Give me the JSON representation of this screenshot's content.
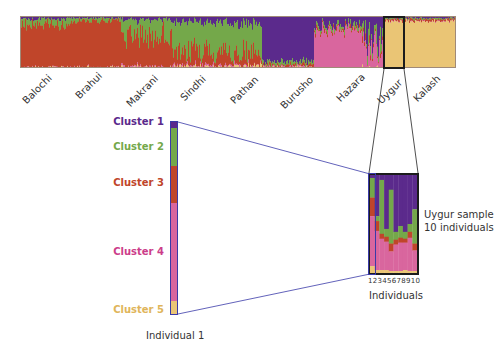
{
  "chart_data": {
    "type": "bar",
    "subtype": "stacked-admixture (STRUCTURE plot)",
    "title": "",
    "colors": {
      "cluster_1": "#5b2a8c",
      "cluster_2": "#74a84a",
      "cluster_3": "#c0452a",
      "cluster_4": "#d9669e",
      "cluster_5": "#eac575"
    },
    "populations": [
      "Balochi",
      "Brahui",
      "Makrani",
      "Sindhi",
      "Pathan",
      "Burusho",
      "Hazara",
      "Uygur",
      "Kalash"
    ],
    "population_dominant_cluster": {
      "Balochi": "cluster_3",
      "Brahui": "cluster_3",
      "Makrani": "cluster_3",
      "Sindhi": "cluster_2",
      "Pathan": "cluster_2",
      "Burusho": "cluster_1",
      "Hazara": "cluster_4",
      "Uygur": "cluster_4",
      "Kalash": "cluster_5"
    },
    "legend": [
      "Cluster 1",
      "Cluster 2",
      "Cluster 3",
      "Cluster 4",
      "Cluster 5"
    ],
    "individual_1_proportions": {
      "cluster_1": 0.03,
      "cluster_2": 0.2,
      "cluster_3": 0.19,
      "cluster_4": 0.51,
      "cluster_5": 0.07
    },
    "uygur_sample": {
      "x": [
        1,
        2,
        3,
        4,
        5,
        6,
        7,
        8,
        9,
        10
      ],
      "xlabel": "Individuals",
      "series": [
        {
          "name": "Cluster 1",
          "values": [
            0.03,
            0.42,
            0.05,
            0.55,
            0.15,
            0.58,
            0.52,
            0.58,
            0.5,
            0.35
          ]
        },
        {
          "name": "Cluster 2",
          "values": [
            0.2,
            0.05,
            0.55,
            0.08,
            0.55,
            0.08,
            0.12,
            0.07,
            0.08,
            0.35
          ]
        },
        {
          "name": "Cluster 3",
          "values": [
            0.19,
            0.1,
            0.05,
            0.05,
            0.08,
            0.05,
            0.05,
            0.04,
            0.06,
            0.07
          ]
        },
        {
          "name": "Cluster 4",
          "values": [
            0.51,
            0.4,
            0.32,
            0.29,
            0.2,
            0.27,
            0.29,
            0.28,
            0.34,
            0.21
          ]
        },
        {
          "name": "Cluster 5",
          "values": [
            0.07,
            0.03,
            0.03,
            0.03,
            0.02,
            0.02,
            0.02,
            0.03,
            0.02,
            0.02
          ]
        }
      ]
    }
  },
  "labels": {
    "populations": [
      "Balochi",
      "Brahui",
      "Makrani",
      "Sindhi",
      "Pathan",
      "Burusho",
      "Hazara",
      "Uygur",
      "Kalash"
    ],
    "clusters": [
      "Cluster 1",
      "Cluster 2",
      "Cluster 3",
      "Cluster 4",
      "Cluster 5"
    ],
    "individual_1": "Individual 1",
    "uygur_caption_line1": "Uygur sample",
    "uygur_caption_line2": "10 individuals",
    "individual_numbers": "12345678910",
    "individuals_axis": "Individuals"
  }
}
